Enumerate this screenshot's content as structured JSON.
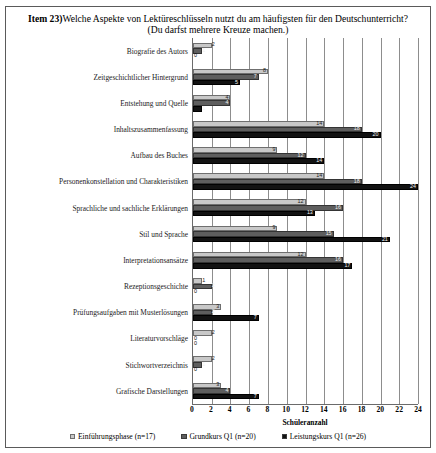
{
  "title": {
    "item_tag": "Item 23)",
    "line1": "Welche Aspekte von Lektüreschlüsseln nutzt du am häufigsten für den Deutschunterricht?",
    "line2": "(Du darfst mehrere Kreuze machen.)"
  },
  "chart_data": {
    "type": "bar",
    "orientation": "horizontal",
    "title": "Welche Aspekte von Lektüreschlüsseln nutzt du am häufigsten für den Deutschunterricht? (Du darfst mehrere Kreuze machen.)",
    "xlabel": "Schüleranzahl",
    "ylabel": "",
    "xlim": [
      0,
      24
    ],
    "xticks": [
      0,
      2,
      4,
      6,
      8,
      10,
      12,
      14,
      16,
      18,
      20,
      22,
      24
    ],
    "grid": true,
    "legend_position": "bottom",
    "categories": [
      "Biografie des Autors",
      "Zeitgeschichtlicher Hintergrund",
      "Entstehung und Quelle",
      "Inhaltszusammenfassung",
      "Aufbau des Buches",
      "Personenkonstellation und Charakteristiken",
      "Sprachliche und sachliche Erklärungen",
      "Stil und Sprache",
      "Interpretationsansätze",
      "Rezeptionsgeschichte",
      "Prüfungsaufgaben mit Musterlösungen",
      "Literaturvorschläge",
      "Stichwortverzeichnis",
      "Grafische Darstellungen"
    ],
    "series": [
      {
        "name": "Einführungsphase (n=17)",
        "color": "#c8c8c8",
        "values": [
          2,
          8,
          4,
          14,
          9,
          14,
          12,
          9,
          12,
          1,
          3,
          2,
          2,
          3
        ]
      },
      {
        "name": "Grundkurs Q1 (n=20)",
        "color": "#5e5e5e",
        "values": [
          1,
          7,
          4,
          18,
          12,
          18,
          16,
          15,
          16,
          2,
          2,
          0,
          1,
          4
        ]
      },
      {
        "name": "Leistungskurs Q1 (n=26)",
        "color": "#121212",
        "values": [
          0,
          5,
          1,
          20,
          14,
          24,
          13,
          21,
          17,
          0,
          7,
          0,
          0,
          7
        ]
      }
    ]
  },
  "axis": {
    "x_label": "Schüleranzahl",
    "ticks": [
      "0",
      "2",
      "4",
      "6",
      "8",
      "10",
      "12",
      "14",
      "16",
      "18",
      "20",
      "22",
      "24"
    ]
  },
  "legend": [
    {
      "label": "Einführungsphase (n=17)",
      "swatch": "s0"
    },
    {
      "label": "Grundkurs Q1 (n=20)",
      "swatch": "s1"
    },
    {
      "label": "Leistungskurs Q1 (n=26)",
      "swatch": "s2"
    }
  ]
}
